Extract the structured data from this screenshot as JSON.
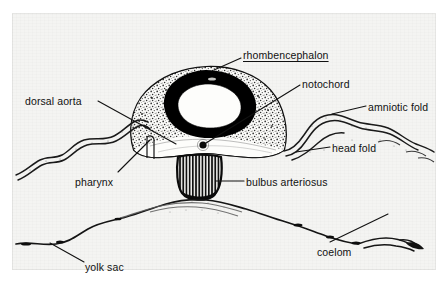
{
  "figure": {
    "kind": "anatomical-diagram",
    "background_color": "#f4f4f2",
    "ink_color": "#111111"
  },
  "labels": [
    {
      "id": "rhombencephalon",
      "text": "rhombencephalon",
      "x": 243,
      "y": 50,
      "underlined": true
    },
    {
      "id": "notochord",
      "text": "notochord",
      "x": 302,
      "y": 79,
      "underlined": false
    },
    {
      "id": "amniotic_fold",
      "text": "amniotic fold",
      "x": 368,
      "y": 102,
      "underlined": false
    },
    {
      "id": "head_fold",
      "text": "head fold",
      "x": 332,
      "y": 143,
      "underlined": false
    },
    {
      "id": "dorsal_aorta",
      "text": "dorsal aorta",
      "x": 25,
      "y": 96,
      "underlined": false
    },
    {
      "id": "pharynx",
      "text": "pharynx",
      "x": 75,
      "y": 177,
      "underlined": false
    },
    {
      "id": "bulbus_arteriosus",
      "text": "bulbus arteriosus",
      "x": 246,
      "y": 177,
      "underlined": false
    },
    {
      "id": "coelom",
      "text": "coelom",
      "x": 317,
      "y": 247,
      "underlined": false
    },
    {
      "id": "yolk_sac",
      "text": "yolk sac",
      "x": 85,
      "y": 262,
      "underlined": false
    }
  ],
  "structures": [
    {
      "id": "neural-tube-lumen",
      "name": "rhombencephalon lumen"
    },
    {
      "id": "neural-tube-wall",
      "name": "rhombencephalon wall"
    },
    {
      "id": "embryo-body",
      "name": "embryo body mesenchyme"
    },
    {
      "id": "notochord-dot",
      "name": "notochord"
    },
    {
      "id": "bulbus-arteriosus",
      "name": "bulbus arteriosus"
    },
    {
      "id": "pharynx-cavity",
      "name": "pharynx"
    },
    {
      "id": "amnion-left",
      "name": "left amniotic fold membrane"
    },
    {
      "id": "amnion-right",
      "name": "right amniotic fold membrane"
    },
    {
      "id": "head-fold-membrane",
      "name": "head fold membrane"
    },
    {
      "id": "yolk-sac-membrane",
      "name": "yolk sac membrane"
    },
    {
      "id": "coelom-space",
      "name": "coelom"
    }
  ]
}
